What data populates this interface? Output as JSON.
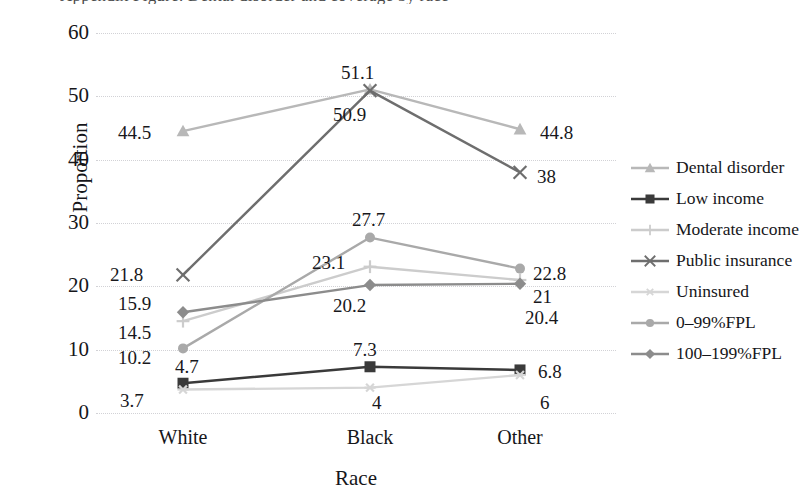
{
  "figure": {
    "title_remnant": "Appendix Figure: Dental disorder and coverage by race",
    "background": "#ffffff"
  },
  "chart_data": {
    "type": "line",
    "title": "",
    "subtitle": "",
    "xlabel": "Race",
    "ylabel": "Proportion",
    "categories": [
      "White",
      "Black",
      "Other"
    ],
    "ylim": [
      0,
      60
    ],
    "yticks": [
      0,
      10,
      20,
      30,
      40,
      50,
      60
    ],
    "grid": "horizontal-dotted",
    "legend_position": "right",
    "series": [
      {
        "name": "Dental disorder",
        "values": [
          44.5,
          51.1,
          44.8
        ],
        "labels": [
          "44.5",
          "51.1",
          "44.8"
        ],
        "color": "#b8b8b8",
        "marker": "triangle"
      },
      {
        "name": "Low income",
        "values": [
          4.7,
          7.3,
          6.8
        ],
        "labels": [
          "4.7",
          "7.3",
          "6.8"
        ],
        "color": "#3a3a3a",
        "marker": "square"
      },
      {
        "name": "Moderate income",
        "values": [
          14.5,
          23.1,
          21
        ],
        "labels": [
          "14.5",
          "23.1",
          "21"
        ],
        "color": "#cccccc",
        "marker": "plus"
      },
      {
        "name": "Public insurance",
        "values": [
          21.8,
          50.9,
          38
        ],
        "labels": [
          "21.8",
          "50.9",
          "38"
        ],
        "color": "#6e6e6e",
        "marker": "cross"
      },
      {
        "name": "Uninsured",
        "values": [
          3.7,
          4,
          6
        ],
        "labels": [
          "3.7",
          "4",
          "6"
        ],
        "color": "#d6d6d6",
        "marker": "asterisk"
      },
      {
        "name": "0–99%FPL",
        "values": [
          10.2,
          27.7,
          22.8
        ],
        "labels": [
          "10.2",
          "27.7",
          "22.8"
        ],
        "color": "#a9a9a9",
        "marker": "circle"
      },
      {
        "name": "100–199%FPL",
        "values": [
          15.9,
          20.2,
          20.4
        ],
        "labels": [
          "15.9",
          "20.2",
          "20.4"
        ],
        "color": "#8c8c8c",
        "marker": "diamond"
      }
    ]
  },
  "axis": {
    "y_ticks": [
      "0",
      "10",
      "20",
      "30",
      "40",
      "50",
      "60"
    ],
    "x_ticks": [
      "White",
      "Black",
      "Other"
    ],
    "y_title": "Proportion",
    "x_title": "Race"
  },
  "legend": {
    "entries": [
      "Dental disorder",
      "Low income",
      "Moderate income",
      "Public insurance",
      "Uninsured",
      "0–99%FPL",
      "100–199%FPL"
    ]
  },
  "point_labels": [
    {
      "text": "44.5",
      "x": 118,
      "y": 123
    },
    {
      "text": "51.1",
      "x": 341,
      "y": 63
    },
    {
      "text": "44.8",
      "x": 540,
      "y": 123
    },
    {
      "text": "50.9",
      "x": 333,
      "y": 105
    },
    {
      "text": "38",
      "x": 537,
      "y": 167
    },
    {
      "text": "21.8",
      "x": 110,
      "y": 265
    },
    {
      "text": "27.7",
      "x": 352,
      "y": 210
    },
    {
      "text": "23.1",
      "x": 312,
      "y": 253
    },
    {
      "text": "22.8",
      "x": 533,
      "y": 264
    },
    {
      "text": "21",
      "x": 533,
      "y": 287
    },
    {
      "text": "20.2",
      "x": 333,
      "y": 296
    },
    {
      "text": "20.4",
      "x": 525,
      "y": 308
    },
    {
      "text": "15.9",
      "x": 118,
      "y": 294
    },
    {
      "text": "14.5",
      "x": 118,
      "y": 323
    },
    {
      "text": "10.2",
      "x": 118,
      "y": 348
    },
    {
      "text": "4.7",
      "x": 175,
      "y": 357
    },
    {
      "text": "7.3",
      "x": 353,
      "y": 340
    },
    {
      "text": "6.8",
      "x": 538,
      "y": 362
    },
    {
      "text": "3.7",
      "x": 120,
      "y": 391
    },
    {
      "text": "4",
      "x": 372,
      "y": 393
    },
    {
      "text": "6",
      "x": 540,
      "y": 393
    }
  ]
}
